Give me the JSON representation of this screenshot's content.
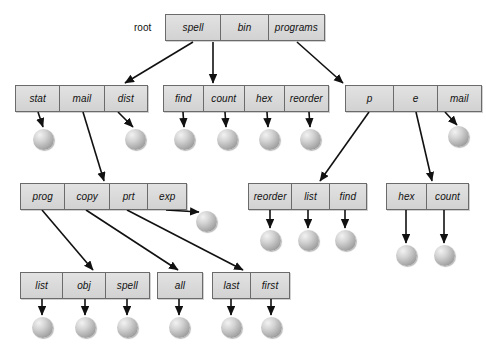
{
  "diagram": {
    "type": "tree-diagram",
    "title": "",
    "root_label": "root",
    "colors": {
      "node_fill": "#d9d9d9",
      "node_border": "#6b6b6b",
      "leaf_fill": "#a8a8a8",
      "edge": "#111111",
      "background": "#ffffff"
    },
    "nodes": [
      {
        "id": "root",
        "x": 165,
        "y": 14,
        "w": 160,
        "cells": [
          {
            "label": "spell",
            "w": 56
          },
          {
            "label": "bin",
            "w": 48
          },
          {
            "label": "programs",
            "w": 56
          }
        ]
      },
      {
        "id": "spell-dir",
        "x": 15,
        "y": 85,
        "w": 133,
        "cells": [
          {
            "label": "stat",
            "w": 45
          },
          {
            "label": "mail",
            "w": 45
          },
          {
            "label": "dist",
            "w": 43
          }
        ]
      },
      {
        "id": "bin-dir",
        "x": 163,
        "y": 85,
        "w": 166,
        "cells": [
          {
            "label": "find",
            "w": 40
          },
          {
            "label": "count",
            "w": 42
          },
          {
            "label": "hex",
            "w": 40
          },
          {
            "label": "reorder",
            "w": 44
          }
        ]
      },
      {
        "id": "programs-dir",
        "x": 345,
        "y": 85,
        "w": 137,
        "cells": [
          {
            "label": "p",
            "w": 49
          },
          {
            "label": "e",
            "w": 44
          },
          {
            "label": "mail",
            "w": 44
          }
        ]
      },
      {
        "id": "mail-dir",
        "x": 20,
        "y": 183,
        "w": 167,
        "cells": [
          {
            "label": "prog",
            "w": 45
          },
          {
            "label": "copy",
            "w": 45
          },
          {
            "label": "prt",
            "w": 39
          },
          {
            "label": "exp",
            "w": 38
          }
        ]
      },
      {
        "id": "p-dir",
        "x": 248,
        "y": 183,
        "w": 119,
        "cells": [
          {
            "label": "reorder",
            "w": 44
          },
          {
            "label": "list",
            "w": 38
          },
          {
            "label": "find",
            "w": 37
          }
        ]
      },
      {
        "id": "e-dir",
        "x": 386,
        "y": 183,
        "w": 83,
        "cells": [
          {
            "label": "hex",
            "w": 41
          },
          {
            "label": "count",
            "w": 42
          }
        ]
      },
      {
        "id": "prog-dir",
        "x": 20,
        "y": 272,
        "w": 130,
        "cells": [
          {
            "label": "list",
            "w": 43
          },
          {
            "label": "obj",
            "w": 43
          },
          {
            "label": "spell",
            "w": 44
          }
        ]
      },
      {
        "id": "copy-dir",
        "x": 157,
        "y": 272,
        "w": 46,
        "cells": [
          {
            "label": "all",
            "w": 46
          }
        ]
      },
      {
        "id": "prt-dir",
        "x": 212,
        "y": 272,
        "w": 78,
        "cells": [
          {
            "label": "last",
            "w": 39
          },
          {
            "label": "first",
            "w": 39
          }
        ]
      }
    ],
    "leaves": [
      {
        "id": "leaf-stat",
        "x": 33,
        "y": 129
      },
      {
        "id": "leaf-dist",
        "x": 125,
        "y": 129
      },
      {
        "id": "leaf-find",
        "x": 174,
        "y": 129
      },
      {
        "id": "leaf-count",
        "x": 217,
        "y": 129
      },
      {
        "id": "leaf-hex",
        "x": 259,
        "y": 129
      },
      {
        "id": "leaf-reorder",
        "x": 300,
        "y": 129
      },
      {
        "id": "leaf-pmail",
        "x": 448,
        "y": 126
      },
      {
        "id": "leaf-exp",
        "x": 196,
        "y": 211
      },
      {
        "id": "leaf-reorder2",
        "x": 260,
        "y": 230
      },
      {
        "id": "leaf-list2",
        "x": 298,
        "y": 230
      },
      {
        "id": "leaf-find2",
        "x": 335,
        "y": 230
      },
      {
        "id": "leaf-hex2",
        "x": 396,
        "y": 245
      },
      {
        "id": "leaf-count2",
        "x": 434,
        "y": 245
      },
      {
        "id": "leaf-list3",
        "x": 32,
        "y": 317
      },
      {
        "id": "leaf-obj",
        "x": 75,
        "y": 317
      },
      {
        "id": "leaf-spell2",
        "x": 117,
        "y": 317
      },
      {
        "id": "leaf-all",
        "x": 169,
        "y": 317
      },
      {
        "id": "leaf-last",
        "x": 221,
        "y": 317
      },
      {
        "id": "leaf-first",
        "x": 261,
        "y": 317
      }
    ],
    "edges": [
      {
        "from": "spell",
        "x1": 193,
        "y1": 42,
        "x2": 125,
        "y2": 83
      },
      {
        "from": "bin",
        "x1": 213,
        "y1": 42,
        "x2": 213,
        "y2": 83
      },
      {
        "from": "programs",
        "x1": 297,
        "y1": 42,
        "x2": 343,
        "y2": 83
      },
      {
        "from": "stat",
        "x1": 38,
        "y1": 112,
        "x2": 43,
        "y2": 127
      },
      {
        "from": "mail",
        "x1": 83,
        "y1": 112,
        "x2": 104,
        "y2": 181
      },
      {
        "from": "dist",
        "x1": 118,
        "y1": 112,
        "x2": 133,
        "y2": 127
      },
      {
        "from": "find",
        "x1": 183,
        "y1": 112,
        "x2": 184,
        "y2": 127
      },
      {
        "from": "count",
        "x1": 225,
        "y1": 112,
        "x2": 226,
        "y2": 127
      },
      {
        "from": "hex",
        "x1": 267,
        "y1": 112,
        "x2": 268,
        "y2": 127
      },
      {
        "from": "reorder",
        "x1": 309,
        "y1": 112,
        "x2": 310,
        "y2": 127
      },
      {
        "from": "p",
        "x1": 369,
        "y1": 112,
        "x2": 320,
        "y2": 181
      },
      {
        "from": "e",
        "x1": 416,
        "y1": 112,
        "x2": 432,
        "y2": 181
      },
      {
        "from": "pmail",
        "x1": 445,
        "y1": 112,
        "x2": 457,
        "y2": 125
      },
      {
        "from": "prog",
        "x1": 42,
        "y1": 210,
        "x2": 93,
        "y2": 270
      },
      {
        "from": "copy",
        "x1": 86,
        "y1": 210,
        "x2": 178,
        "y2": 270
      },
      {
        "from": "prt",
        "x1": 127,
        "y1": 210,
        "x2": 243,
        "y2": 270
      },
      {
        "from": "exp",
        "x1": 166,
        "y1": 210,
        "x2": 199,
        "y2": 212
      },
      {
        "from": "reorder2",
        "x1": 270,
        "y1": 210,
        "x2": 270,
        "y2": 228
      },
      {
        "from": "list2",
        "x1": 308,
        "y1": 210,
        "x2": 308,
        "y2": 228
      },
      {
        "from": "find2",
        "x1": 345,
        "y1": 210,
        "x2": 345,
        "y2": 228
      },
      {
        "from": "hex2",
        "x1": 406,
        "y1": 210,
        "x2": 406,
        "y2": 243
      },
      {
        "from": "count2",
        "x1": 444,
        "y1": 210,
        "x2": 444,
        "y2": 243
      },
      {
        "from": "list3",
        "x1": 42,
        "y1": 299,
        "x2": 42,
        "y2": 315
      },
      {
        "from": "obj",
        "x1": 85,
        "y1": 299,
        "x2": 85,
        "y2": 315
      },
      {
        "from": "spell2",
        "x1": 127,
        "y1": 299,
        "x2": 127,
        "y2": 315
      },
      {
        "from": "all",
        "x1": 179,
        "y1": 299,
        "x2": 179,
        "y2": 315
      },
      {
        "from": "last",
        "x1": 231,
        "y1": 299,
        "x2": 231,
        "y2": 315
      },
      {
        "from": "first",
        "x1": 271,
        "y1": 299,
        "x2": 271,
        "y2": 315
      }
    ]
  }
}
